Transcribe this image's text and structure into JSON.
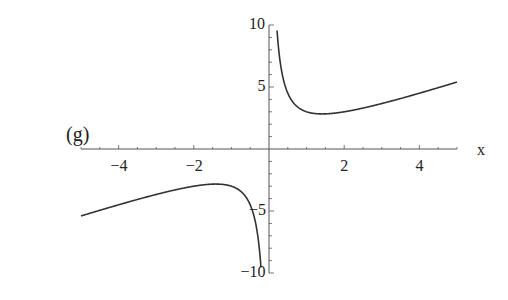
{
  "panel_label": "(g)",
  "chart_data": {
    "type": "line",
    "title": "",
    "function": "y = x + 2/x",
    "xlabel": "x",
    "ylabel": "",
    "xlim": [
      -5,
      5
    ],
    "ylim": [
      -10,
      10
    ],
    "grid": false,
    "x_ticks": [
      {
        "value": -4,
        "label": "−4"
      },
      {
        "value": -2,
        "label": "−2"
      },
      {
        "value": 2,
        "label": "2"
      },
      {
        "value": 4,
        "label": "4"
      }
    ],
    "y_ticks": [
      {
        "value": 10,
        "label": "10"
      },
      {
        "value": 5,
        "label": "5"
      },
      {
        "value": -5,
        "label": "−5"
      },
      {
        "value": -10,
        "label": "−10"
      }
    ],
    "series": [
      {
        "name": "right branch",
        "x": [
          0.2,
          0.3,
          0.5,
          0.75,
          1,
          1.414,
          2,
          3,
          4,
          5
        ],
        "values": [
          10.2,
          6.97,
          4.5,
          3.42,
          3,
          2.83,
          3,
          3.67,
          4.5,
          5.4
        ]
      },
      {
        "name": "left branch",
        "x": [
          -5,
          -4,
          -3,
          -2,
          -1.414,
          -1,
          -0.75,
          -0.5,
          -0.3,
          -0.2
        ],
        "values": [
          -5.4,
          -4.5,
          -3.67,
          -3,
          -2.83,
          -3,
          -3.42,
          -4.5,
          -6.97,
          -10.2
        ]
      }
    ],
    "asymptotes": {
      "vertical": 0,
      "oblique": "y = x"
    },
    "stroke_color": "#333333"
  }
}
